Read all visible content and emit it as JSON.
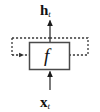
{
  "figure": {
    "kind": "recurrent-cell-diagram",
    "background_color": "#ffffff",
    "ink_color": "#111111",
    "recurrent_color": "#3a3a3a"
  },
  "labels": {
    "output": {
      "symbol": "h",
      "subscript": "t",
      "text": "h_t"
    },
    "input": {
      "symbol": "x",
      "subscript": "t",
      "text": "x_t"
    },
    "function": {
      "text": "f"
    }
  },
  "nodes": [
    {
      "id": "cell-box",
      "label": "f",
      "shape": "rectangle",
      "x": 29,
      "y": 42,
      "width": 41,
      "height": 28,
      "stroke": "#4a4a4a",
      "fill": "#ffffff"
    }
  ],
  "edges": [
    {
      "id": "input-edge",
      "from": "x_t",
      "to": "cell-box",
      "style": "solid",
      "direction": "up",
      "arrowhead": true
    },
    {
      "id": "output-edge",
      "from": "cell-box",
      "to": "h_t",
      "style": "solid",
      "direction": "up",
      "arrowhead": true
    },
    {
      "id": "recurrent-edge",
      "from": "output-edge-tap",
      "to": "cell-box",
      "style": "dashed",
      "direction": "loop-right-down-left",
      "arrowhead": true
    }
  ]
}
